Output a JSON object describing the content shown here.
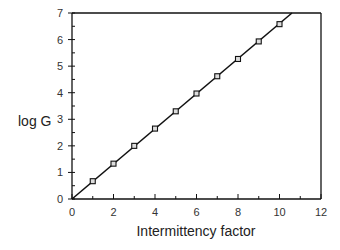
{
  "chart_data": {
    "type": "scatter",
    "title": "",
    "xlabel": "Intermittency factor",
    "ylabel": "log G",
    "xlim": [
      0,
      12
    ],
    "ylim": [
      0,
      7
    ],
    "xticks": [
      0,
      2,
      4,
      6,
      8,
      10,
      12
    ],
    "yticks": [
      0,
      1,
      2,
      3,
      4,
      5,
      6,
      7
    ],
    "grid": false,
    "legend": null,
    "series": [
      {
        "name": "data",
        "marker": "open-square",
        "x": [
          1,
          2,
          3,
          4,
          5,
          6,
          7,
          8,
          9,
          10
        ],
        "y": [
          0.67,
          1.33,
          2.0,
          2.65,
          3.3,
          3.97,
          4.62,
          5.27,
          5.93,
          6.58
        ]
      },
      {
        "name": "fit",
        "style": "line",
        "x": [
          0,
          10.6
        ],
        "y": [
          0,
          7
        ]
      }
    ]
  },
  "labels": {
    "xlabel": "Intermittency factor",
    "ylabel": "log G"
  }
}
